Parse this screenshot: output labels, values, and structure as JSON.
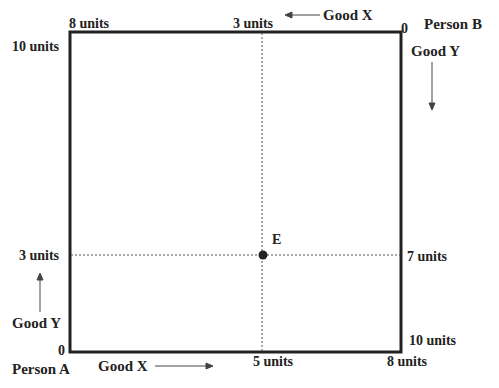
{
  "diagram": {
    "type": "edgeworth-box",
    "box": {
      "left": 70,
      "top": 32,
      "right": 401,
      "bottom": 352,
      "stroke": "#222222"
    },
    "point_E": {
      "label": "E",
      "x": 263,
      "y": 255
    },
    "person_a": {
      "name": "Person A",
      "origin": "0",
      "good_x_label": "Good X",
      "good_y_label": "Good Y"
    },
    "person_b": {
      "name": "Person B",
      "origin": "0",
      "good_x_label": "Good X",
      "good_y_label": "Good Y"
    },
    "labels": {
      "top_left": "8 units",
      "top_mid": "3 units",
      "left_top": "10 units",
      "left_mid": "3 units",
      "right_mid": "7 units",
      "right_bottom": "10 units",
      "bottom_mid": "5 units",
      "bottom_right": "8 units"
    }
  }
}
